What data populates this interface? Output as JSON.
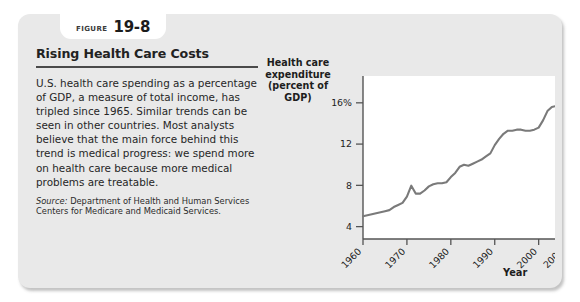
{
  "figure": {
    "badge_word": "Figure",
    "badge_number": "19-8",
    "title": "Rising Health Care Costs",
    "body": "U.S. health care spending as a percentage of GDP, a measure of total income, has tripled since 1965. Similar trends can be seen in other countries. Most analysts believe that the main force behind this trend is medical progress: we spend more on health care because more medical problems are treatable.",
    "source_label": "Source:",
    "source_text": "Department of Health and Human Services Centers for Medicare and Medicaid Services.",
    "card_background": "#e9e9e9",
    "badge_background": "#ffffff"
  },
  "chart_data": {
    "type": "line",
    "title": "",
    "ylabel": "Health care expenditure (percent of GDP)",
    "ylabel_lines": [
      "Health care",
      "expenditure",
      "(percent of GDP)"
    ],
    "xlabel": "Year",
    "xlim": [
      1960,
      2006
    ],
    "ylim": [
      2.8,
      18.6
    ],
    "grid": false,
    "legend": null,
    "line_color": "#7a7a7a",
    "plot_background": "#ffffff",
    "y_ticks": [
      4,
      8,
      12,
      16
    ],
    "y_tick_labels": [
      "4",
      "8",
      "12",
      "16%"
    ],
    "x_ticks": [
      1960,
      1970,
      1980,
      1990,
      2000,
      2006
    ],
    "x_tick_labels": [
      "1960",
      "1970",
      "1980",
      "1990",
      "2000",
      "2006"
    ],
    "x_tick_rotation": 45,
    "series": [
      {
        "name": "Health care expenditure (percent of GDP)",
        "x": [
          1960,
          1961,
          1962,
          1963,
          1964,
          1965,
          1966,
          1967,
          1968,
          1969,
          1970,
          1971,
          1972,
          1973,
          1974,
          1975,
          1976,
          1977,
          1978,
          1979,
          1980,
          1981,
          1982,
          1983,
          1984,
          1985,
          1986,
          1987,
          1988,
          1989,
          1990,
          1991,
          1992,
          1993,
          1994,
          1995,
          1996,
          1997,
          1998,
          1999,
          2000,
          2001,
          2002,
          2003,
          2004,
          2005,
          2006
        ],
        "values": [
          5.0,
          5.1,
          5.2,
          5.3,
          5.4,
          5.5,
          5.6,
          5.9,
          6.1,
          6.3,
          6.9,
          7.972,
          7.2,
          7.2,
          7.5,
          7.9,
          8.1,
          8.2,
          8.2,
          8.3,
          8.8,
          9.2,
          9.8,
          10.0,
          9.9,
          10.1,
          10.3,
          10.5,
          10.8,
          11.1,
          11.9,
          12.5,
          13.0,
          13.3,
          13.3,
          13.4,
          13.4,
          13.3,
          13.3,
          13.4,
          13.6,
          14.3,
          15.2,
          15.6,
          15.7,
          15.8,
          16.0
        ]
      }
    ]
  }
}
